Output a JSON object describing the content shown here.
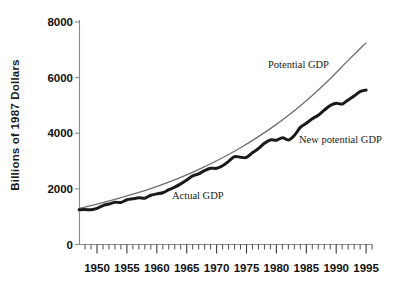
{
  "chart_data": {
    "type": "line",
    "title": "",
    "xlabel": "",
    "ylabel": "Billions of 1987 Dollars",
    "xlim": [
      1947,
      1996
    ],
    "ylim": [
      0,
      8000
    ],
    "grid": false,
    "legend_position": "inline-annotations",
    "ytick_labels": [
      "0",
      "2000",
      "4000",
      "6000",
      "8000"
    ],
    "ytick_values": [
      0,
      2000,
      4000,
      6000,
      8000
    ],
    "xtick_labels": [
      "1950",
      "1955",
      "1960",
      "1965",
      "1970",
      "1975",
      "1980",
      "1985",
      "1990",
      "1995"
    ],
    "xtick_values": [
      1950,
      1955,
      1960,
      1965,
      1970,
      1975,
      1980,
      1985,
      1990,
      1995
    ],
    "minor_xtick_interval": 1,
    "annotations": [
      {
        "name": "potential-gdp-label",
        "text": "Potential GDP"
      },
      {
        "name": "new-potential-gdp-label",
        "text": "New potential GDP"
      },
      {
        "name": "actual-gdp-label",
        "text": "Actual GDP"
      }
    ],
    "colors": {
      "actual_gdp": "#1a1a1a",
      "potential_gdp": "#6e6e6e",
      "axis": "#8a8a8a",
      "text": "#111111"
    },
    "series": [
      {
        "name": "Potential GDP",
        "color": "#6e6e6e",
        "width": 1.3,
        "x": [
          1947,
          1950,
          1953,
          1956,
          1959,
          1962,
          1965,
          1968,
          1971,
          1974,
          1977,
          1980,
          1983,
          1986,
          1989,
          1992,
          1995
        ],
        "values": [
          1300,
          1450,
          1620,
          1810,
          2010,
          2240,
          2500,
          2800,
          3120,
          3480,
          3880,
          4320,
          4810,
          5360,
          5960,
          6620,
          7250
        ]
      },
      {
        "name": "Actual GDP / New potential GDP",
        "color": "#1a1a1a",
        "width": 3.0,
        "x": [
          1947,
          1948,
          1949,
          1950,
          1951,
          1952,
          1953,
          1954,
          1955,
          1956,
          1957,
          1958,
          1959,
          1960,
          1961,
          1962,
          1963,
          1964,
          1965,
          1966,
          1967,
          1968,
          1969,
          1970,
          1971,
          1972,
          1973,
          1974,
          1975,
          1976,
          1977,
          1978,
          1979,
          1980,
          1981,
          1982,
          1983,
          1984,
          1985,
          1986,
          1987,
          1988,
          1989,
          1990,
          1991,
          1992,
          1993,
          1994,
          1995
        ],
        "values": [
          1250,
          1255,
          1250,
          1300,
          1400,
          1455,
          1520,
          1510,
          1610,
          1645,
          1680,
          1665,
          1770,
          1820,
          1860,
          1970,
          2060,
          2180,
          2320,
          2470,
          2540,
          2660,
          2740,
          2740,
          2830,
          2990,
          3160,
          3140,
          3130,
          3300,
          3450,
          3640,
          3760,
          3750,
          3840,
          3760,
          3920,
          4210,
          4360,
          4520,
          4650,
          4830,
          5000,
          5080,
          5050,
          5200,
          5340,
          5500,
          5550
        ]
      }
    ]
  },
  "axes": {
    "y_axis_label": "Billions of 1987 Dollars"
  }
}
